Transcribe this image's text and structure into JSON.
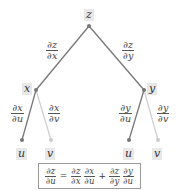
{
  "diagram": {
    "type": "tree",
    "nodes": {
      "root": "z",
      "left": "x",
      "right": "y",
      "left_left": "u",
      "left_right": "v",
      "right_left": "u",
      "right_right": "v"
    },
    "edges": {
      "z_x": {
        "num": "∂z",
        "den": "∂x"
      },
      "z_y": {
        "num": "∂z",
        "den": "∂y"
      },
      "x_u": {
        "num": "∂x",
        "den": "∂u"
      },
      "x_v": {
        "num": "∂x",
        "den": "∂v"
      },
      "y_u": {
        "num": "∂y",
        "den": "∂u"
      },
      "y_v": {
        "num": "∂y",
        "den": "∂v"
      }
    },
    "colors": {
      "active_edge": "#777777",
      "inactive_edge": "#d0d0d0",
      "label_bg": "#e8e8e8"
    },
    "formula": {
      "lhs": {
        "num": "∂z",
        "den": "∂u"
      },
      "eq": "=",
      "t1a": {
        "num": "∂z",
        "den": "∂x"
      },
      "t1b": {
        "num": "∂x",
        "den": "∂u"
      },
      "plus": "+",
      "t2a": {
        "num": "∂z",
        "den": "∂y"
      },
      "t2b": {
        "num": "∂y",
        "den": "∂u"
      }
    }
  }
}
